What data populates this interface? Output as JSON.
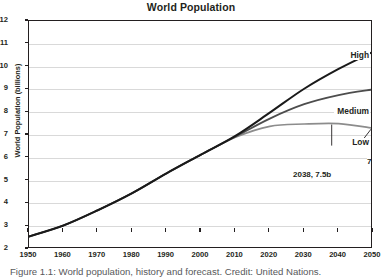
{
  "chart_data": {
    "type": "line",
    "title": "World Population",
    "xlabel": "",
    "ylabel": "World Population (billions)",
    "xlim": [
      1950,
      2050
    ],
    "ylim": [
      2,
      12
    ],
    "grid": true,
    "legend": "inline-right-end-labels",
    "x_ticks": [
      "1950",
      "1960",
      "1970",
      "1980",
      "1990",
      "2000",
      "2010",
      "2020",
      "2030",
      "2040",
      "2050"
    ],
    "y_ticks": [
      "2",
      "3",
      "4",
      "5",
      "6",
      "7",
      "8",
      "9",
      "10",
      "11",
      "12"
    ],
    "x": [
      1950,
      1960,
      1970,
      1980,
      1990,
      2000,
      2010,
      2020,
      2030,
      2040,
      2050
    ],
    "series": [
      {
        "name": "High",
        "color": "#1a1a1a",
        "width": 2.0,
        "values": [
          2.55,
          3.03,
          3.7,
          4.45,
          5.32,
          6.14,
          6.96,
          7.98,
          9.03,
          9.9,
          10.65
        ]
      },
      {
        "name": "Medium",
        "color": "#4d4d4d",
        "width": 1.8,
        "values": [
          2.55,
          3.03,
          3.7,
          4.45,
          5.32,
          6.14,
          6.93,
          7.72,
          8.35,
          8.75,
          9.0
        ]
      },
      {
        "name": "Low",
        "color": "#8c8c8c",
        "width": 1.6,
        "values": [
          2.55,
          3.03,
          3.7,
          4.45,
          5.32,
          6.14,
          6.9,
          7.38,
          7.48,
          7.5,
          7.3
        ]
      }
    ],
    "annotations": [
      {
        "id": "a1",
        "text": "2038, 7.5b",
        "x": 2038,
        "y": 7.5
      },
      {
        "id": "a2",
        "text": "7.3b",
        "x": 2050,
        "y": 7.3
      }
    ]
  },
  "caption": {
    "text": "Figure 1.1: World population, history and forecast. Credit: United Nations."
  }
}
